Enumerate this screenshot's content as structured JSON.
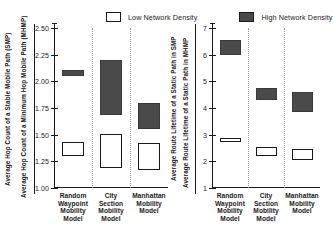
{
  "legend": {
    "entries": [
      {
        "label": "Low Network Density",
        "color": "#ffffff",
        "key": "low"
      },
      {
        "label": "High Network Density",
        "color": "#4a4a4a",
        "key": "high"
      }
    ]
  },
  "categories_short": [
    "Random\nWaypoint\nMobility\nModel",
    "City\nSection\nMobility\nModel",
    "Manhattan\nMobility\nModel"
  ],
  "left_panel": {
    "outer_title": "Average Hop Count of a Stable Mobile Path (SMP)",
    "inner_title": "Average Hop Count of a Minimum Hop Mobile Path (MHMP)",
    "ticks": [
      "1.00",
      "1.25",
      "1.50",
      "1.75",
      "2.00",
      "2.25",
      "2.50"
    ],
    "cat0_l0": "Random",
    "cat0_l1": "Waypoint",
    "cat0_l2": "Mobility",
    "cat0_l3": "Model",
    "cat1_l0": "City",
    "cat1_l1": "Section",
    "cat1_l2": "Mobility",
    "cat1_l3": "Model",
    "cat2_l0": "Manhattan",
    "cat2_l1": "Mobility",
    "cat2_l2": "Model",
    "cat2_l3": ""
  },
  "right_panel": {
    "outer_title": "Average Route Lifetime of a Static Path in SMP",
    "inner_title": "Average Route Lifetime of a Static Path in MHMP",
    "ticks": [
      "1",
      "2",
      "3",
      "4",
      "5",
      "6",
      "7"
    ],
    "cat0_l0": "Random",
    "cat0_l1": "Waypoint",
    "cat0_l2": "Mobility",
    "cat0_l3": "Model",
    "cat1_l0": "City",
    "cat1_l1": "Section",
    "cat1_l2": "Mobility",
    "cat1_l3": "Model",
    "cat2_l0": "Manhattan",
    "cat2_l1": "Mobility",
    "cat2_l2": "Model",
    "cat2_l3": ""
  },
  "chart_data": [
    {
      "type": "bar",
      "subtype": "range-box",
      "title": "",
      "xlabel": "",
      "ylabel": "Average Hop Count of a Minimum Hop Mobile Path (MHMP)",
      "ylabel_secondary": "Average Hop Count of a Stable Mobile Path (SMP)",
      "ylim": [
        1.0,
        2.5
      ],
      "yticks": [
        1.0,
        1.25,
        1.5,
        1.75,
        2.0,
        2.25,
        2.5
      ],
      "grid": false,
      "legend_position": "top",
      "categories": [
        "Random Waypoint Mobility Model",
        "City Section Mobility Model",
        "Manhattan Mobility Model"
      ],
      "series": [
        {
          "name": "Low Network Density",
          "color": "#ffffff",
          "ranges": [
            [
              1.3,
              1.43
            ],
            [
              1.19,
              1.51
            ],
            [
              1.17,
              1.42
            ]
          ]
        },
        {
          "name": "High Network Density",
          "color": "#4a4a4a",
          "ranges": [
            [
              2.05,
              2.11
            ],
            [
              1.68,
              2.2
            ],
            [
              1.55,
              1.8
            ]
          ]
        }
      ]
    },
    {
      "type": "bar",
      "subtype": "range-box",
      "title": "",
      "xlabel": "",
      "ylabel": "Average Route Lifetime of a Static Path in MHMP",
      "ylabel_secondary": "Average Route Lifetime of a Static Path in SMP",
      "ylim": [
        1,
        7
      ],
      "yticks": [
        1,
        2,
        3,
        4,
        5,
        6,
        7
      ],
      "grid": false,
      "legend_position": "top",
      "categories": [
        "Random Waypoint Mobility Model",
        "City Section Mobility Model",
        "Manhattan Mobility Model"
      ],
      "series": [
        {
          "name": "Low Network Density",
          "color": "#ffffff",
          "ranges": [
            [
              2.72,
              2.88
            ],
            [
              2.2,
              2.55
            ],
            [
              2.05,
              2.45
            ]
          ]
        },
        {
          "name": "High Network Density",
          "color": "#4a4a4a",
          "ranges": [
            [
              6.0,
              6.55
            ],
            [
              4.3,
              4.75
            ],
            [
              3.85,
              4.6
            ]
          ]
        }
      ]
    }
  ]
}
